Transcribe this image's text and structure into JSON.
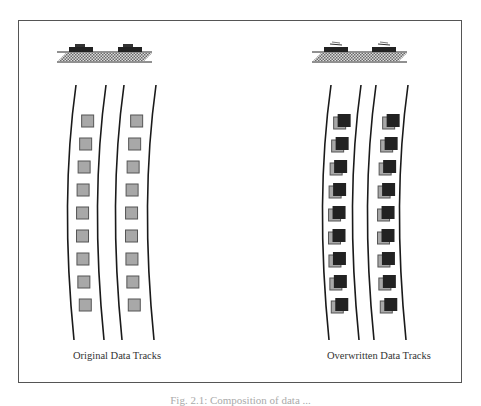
{
  "figure": {
    "panels": [
      {
        "id": "original",
        "label": "Original Data Tracks",
        "bit_style": "single-gray",
        "tracks": 2,
        "bits_per_track": 9
      },
      {
        "id": "overwritten",
        "label": "Overwritten Data Tracks",
        "bit_style": "gray-with-dark-overlay",
        "tracks": 2,
        "bits_per_track": 9
      }
    ],
    "caption": "Fig. 2.1: Composition of data ..."
  },
  "colors": {
    "frame": "#555555",
    "track_line": "#1a1a1a",
    "original_bit": "#a8a8a8",
    "overwrite_bit": "#222222",
    "media_hatch": "#777777"
  }
}
